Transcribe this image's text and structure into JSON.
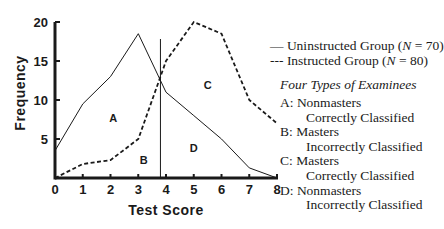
{
  "chart_data": {
    "type": "line",
    "title": "",
    "xlabel": "Test Score",
    "ylabel": "Frequency",
    "x": [
      0,
      1,
      2,
      3,
      4,
      5,
      6,
      7,
      8
    ],
    "xlim": [
      0,
      8
    ],
    "ylim": [
      0,
      20
    ],
    "xticks": [
      0,
      1,
      2,
      3,
      4,
      5,
      6,
      7,
      8
    ],
    "yticks": [
      5,
      10,
      15,
      20
    ],
    "grid": false,
    "series": [
      {
        "name": "Uninstructed Group (N = 70)",
        "style": "solid",
        "values": [
          3.5,
          9.5,
          13,
          18.5,
          11,
          8,
          5,
          1.3,
          0
        ]
      },
      {
        "name": "Instructed Group (N = 80)",
        "style": "dashed",
        "values": [
          0,
          1.8,
          2.3,
          5,
          15,
          20,
          18.5,
          10,
          7
        ]
      }
    ],
    "cut_score": 3.8,
    "region_labels": [
      {
        "label": "A",
        "x": 2.1,
        "y": 7.7
      },
      {
        "label": "B",
        "x": 3.2,
        "y": 2.3
      },
      {
        "label": "C",
        "x": 5.5,
        "y": 11.9
      },
      {
        "label": "D",
        "x": 5.0,
        "y": 3.9
      }
    ],
    "legend_position": "right"
  },
  "legend": {
    "uninstructed": {
      "symbol": "—",
      "label_pre": "Uninstructed Group (",
      "n_sym": "N",
      "label_post": " = 70)"
    },
    "instructed": {
      "symbol": "---",
      "label_pre": "Instructed Group (",
      "n_sym": "N",
      "label_post": " = 80)"
    }
  },
  "types": {
    "title": "Four Types of Examinees",
    "items": [
      {
        "key": "A:",
        "line1": "Nonmasters",
        "line2": "Correctly Classified"
      },
      {
        "key": "B:",
        "line1": "Masters",
        "line2": "Incorrectly Classified"
      },
      {
        "key": "C:",
        "line1": "Masters",
        "line2": "Correctly Classified"
      },
      {
        "key": "D:",
        "line1": "Nonmasters",
        "line2": "Incorrectly Classified"
      }
    ]
  },
  "colors": {
    "ink": "#1a1a1a",
    "background": "#ffffff"
  }
}
